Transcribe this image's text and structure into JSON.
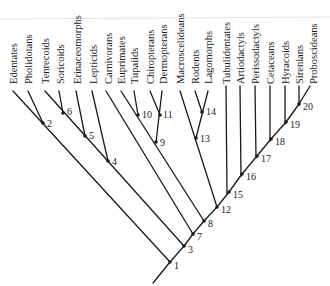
{
  "diagram": {
    "type": "cladogram",
    "taxa": [
      {
        "id": "edentates",
        "label": "Edentates",
        "x": 13
      },
      {
        "id": "pholidotans",
        "label": "Pholidotans",
        "x": 28
      },
      {
        "id": "tenrecoids",
        "label": "Tenrecoids",
        "x": 45
      },
      {
        "id": "soricoids",
        "label": "Soricoids",
        "x": 60
      },
      {
        "id": "erinaceomorphs",
        "label": "Erinaceomorphs",
        "x": 77
      },
      {
        "id": "lepticids",
        "label": "Lepticids",
        "x": 93
      },
      {
        "id": "carnivorans",
        "label": "Carnivorans",
        "x": 108
      },
      {
        "id": "euprimates",
        "label": "Euprimates",
        "x": 121
      },
      {
        "id": "tupaiids",
        "label": "Tupaiids",
        "x": 134
      },
      {
        "id": "chiropterans",
        "label": "Chiropterans",
        "x": 150
      },
      {
        "id": "dermopterans",
        "label": "Dermopterans",
        "x": 163
      },
      {
        "id": "macroscelideans",
        "label": "Macroscelideans",
        "x": 180
      },
      {
        "id": "rodents",
        "label": "Rodents",
        "x": 195
      },
      {
        "id": "lagomorphs",
        "label": "Lagomorphs",
        "x": 208
      },
      {
        "id": "tubulidentates",
        "label": "Tubulidentates",
        "x": 226
      },
      {
        "id": "artiodactyls",
        "label": "Artiodactyls",
        "x": 240
      },
      {
        "id": "perissodactyls",
        "label": "Perissodactyls",
        "x": 255
      },
      {
        "id": "cetaceans",
        "label": "Cetaceans",
        "x": 270
      },
      {
        "id": "hyracoids",
        "label": "Hyracoids",
        "x": 285
      },
      {
        "id": "sirenians",
        "label": "Sirenians",
        "x": 299
      },
      {
        "id": "proboscideans",
        "label": "Proboscideans",
        "x": 313
      }
    ],
    "nodes": [
      {
        "id": "1",
        "label": "1",
        "x": 170,
        "y": 262
      },
      {
        "id": "2",
        "label": "2",
        "x": 43,
        "y": 123
      },
      {
        "id": "3",
        "label": "3",
        "x": 184,
        "y": 246
      },
      {
        "id": "4",
        "label": "4",
        "x": 108,
        "y": 161
      },
      {
        "id": "5",
        "label": "5",
        "x": 85,
        "y": 136
      },
      {
        "id": "6",
        "label": "6",
        "x": 63,
        "y": 113
      },
      {
        "id": "7",
        "label": "7",
        "x": 193,
        "y": 234
      },
      {
        "id": "8",
        "label": "8",
        "x": 204,
        "y": 221
      },
      {
        "id": "9",
        "label": "9",
        "x": 156,
        "y": 142
      },
      {
        "id": "10",
        "label": "10",
        "x": 138,
        "y": 115
      },
      {
        "id": "11",
        "label": "11",
        "x": 160,
        "y": 115
      },
      {
        "id": "12",
        "label": "12",
        "x": 217,
        "y": 207
      },
      {
        "id": "13",
        "label": "13",
        "x": 196,
        "y": 138
      },
      {
        "id": "14",
        "label": "14",
        "x": 202,
        "y": 112
      },
      {
        "id": "15",
        "label": "15",
        "x": 229,
        "y": 192
      },
      {
        "id": "16",
        "label": "16",
        "x": 242,
        "y": 174
      },
      {
        "id": "17",
        "label": "17",
        "x": 257,
        "y": 156
      },
      {
        "id": "18",
        "label": "18",
        "x": 271,
        "y": 139
      },
      {
        "id": "19",
        "label": "19",
        "x": 286,
        "y": 122
      },
      {
        "id": "20",
        "label": "20",
        "x": 299,
        "y": 104
      }
    ]
  }
}
